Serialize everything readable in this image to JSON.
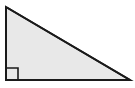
{
  "figure": {
    "name": "right-triangle",
    "type": "geometric-diagram",
    "shape_label": "Right triangle",
    "canvas": {
      "width": 135,
      "height": 88
    },
    "background_color": "#ffffff",
    "fill_color": "#e8e8e8",
    "stroke_color": "#1a1a1a",
    "stroke_width": 2,
    "vertices": [
      {
        "name": "top-left-apex",
        "x": 6,
        "y": 7
      },
      {
        "name": "bottom-right",
        "x": 130,
        "y": 80
      },
      {
        "name": "bottom-left-right-angle",
        "x": 6,
        "y": 80
      }
    ],
    "edges": [
      {
        "name": "vertical-leg",
        "from": "top-left-apex",
        "to": "bottom-left-right-angle"
      },
      {
        "name": "horizontal-leg",
        "from": "bottom-left-right-angle",
        "to": "bottom-right"
      },
      {
        "name": "hypotenuse",
        "from": "top-left-apex",
        "to": "bottom-right"
      }
    ],
    "right_angle_marker": {
      "name": "right-angle-square",
      "at_vertex": "bottom-left-right-angle",
      "size": 12,
      "x": 6,
      "y": 68,
      "stroke_color": "#1a1a1a",
      "stroke_width": 1.6,
      "fill": "none"
    },
    "labels": [],
    "measurements": []
  }
}
